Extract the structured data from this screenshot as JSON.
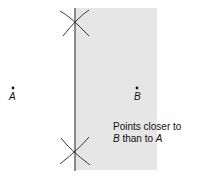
{
  "diagram": {
    "points": [
      {
        "id": "A",
        "label": "A",
        "x": 13,
        "y": 89
      },
      {
        "id": "B",
        "label": "B",
        "x": 137,
        "y": 89
      }
    ],
    "region": {
      "label_line1": "Points closer to",
      "label_line2_prefix": "B",
      "label_line2_mid": " than to ",
      "label_line2_suffix": "A",
      "fill": "#e6e6e6"
    },
    "bisector": {
      "x": 75,
      "y_top": 8,
      "y_bottom": 170
    },
    "arc_intersections": [
      {
        "x": 75,
        "y": 22
      },
      {
        "x": 75,
        "y": 153
      }
    ],
    "colors": {
      "line": "#222222",
      "shade": "#e6e6e6",
      "text": "#111111"
    }
  }
}
